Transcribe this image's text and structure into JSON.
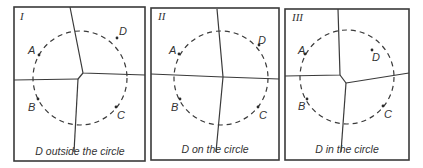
{
  "figure": {
    "panels": [
      {
        "id": "I",
        "caption": "D outside the circle",
        "points": {
          "A": "A",
          "B": "B",
          "C": "C",
          "D": "D"
        }
      },
      {
        "id": "II",
        "caption": "D on the circle",
        "points": {
          "A": "A",
          "B": "B",
          "C": "C",
          "D": "D"
        }
      },
      {
        "id": "III",
        "caption": "D in the circle",
        "points": {
          "A": "A",
          "B": "B",
          "C": "C",
          "D": "D"
        }
      }
    ]
  }
}
